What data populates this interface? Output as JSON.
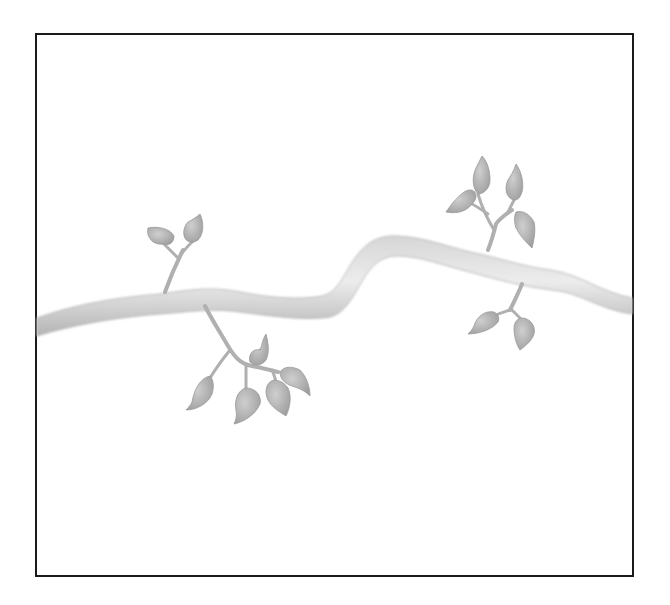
{
  "illustration": {
    "subject": "Watercolor branch with leaves",
    "style": "grayscale watercolor",
    "frame": {
      "border_color": "#1a1a1a",
      "background": "#ffffff"
    },
    "colors": {
      "branch_light": "#e2e2e2",
      "branch_mid": "#c8c8c8",
      "branch_dark": "#a8a8a8",
      "leaf_fill": "#b9b9b9",
      "leaf_dark": "#9a9a9a",
      "stem": "#b0b0b0"
    },
    "leaf_clusters": [
      {
        "name": "upper-left",
        "leaves": 2
      },
      {
        "name": "lower-center",
        "leaves": 5
      },
      {
        "name": "upper-right",
        "leaves": 4
      },
      {
        "name": "lower-right",
        "leaves": 2
      }
    ]
  }
}
